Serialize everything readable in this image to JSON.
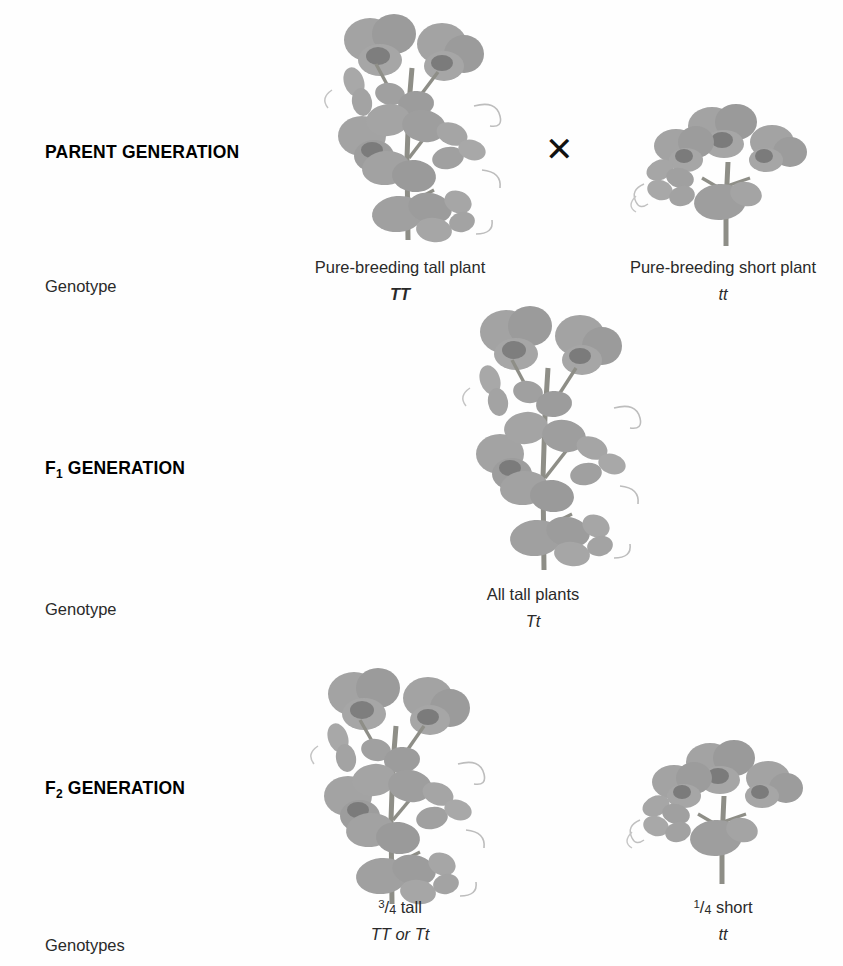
{
  "diagram": {
    "cross_symbol": "✕",
    "illustration_color": "#9a9a9a",
    "stem_color": "#8b8b84"
  },
  "rows": [
    {
      "id": "parent",
      "heading": "PARENT GENERATION",
      "heading_sub": "",
      "side_label": "Genotype",
      "organisms": [
        {
          "name": "tall-parent",
          "phenotype": "Pure-breeding tall plant",
          "genotype": "TT",
          "genotype_bold": true,
          "fraction": null,
          "plant_type": "tall"
        },
        {
          "name": "short-parent",
          "phenotype": "Pure-breeding short plant",
          "genotype": "tt",
          "genotype_bold": false,
          "fraction": null,
          "plant_type": "short"
        }
      ]
    },
    {
      "id": "f1",
      "heading": "F",
      "heading_sub": "1",
      "heading_rest": " GENERATION",
      "side_label": "Genotype",
      "organisms": [
        {
          "name": "f1-offspring",
          "phenotype": "All tall plants",
          "genotype": "Tt",
          "genotype_bold": false,
          "fraction": null,
          "plant_type": "tall"
        }
      ]
    },
    {
      "id": "f2",
      "heading": "F",
      "heading_sub": "2",
      "heading_rest": " GENERATION",
      "side_label": "Genotypes",
      "organisms": [
        {
          "name": "f2-tall",
          "phenotype": "tall",
          "fraction_numerator": "3",
          "fraction_denominator": "4",
          "genotype": "TT or Tt",
          "genotype_bold": false,
          "plant_type": "tall"
        },
        {
          "name": "f2-short",
          "phenotype": "short",
          "fraction_numerator": "1",
          "fraction_denominator": "4",
          "genotype": "tt",
          "genotype_bold": false,
          "plant_type": "short"
        }
      ]
    }
  ],
  "labels": {
    "parent_heading": "PARENT GENERATION",
    "f1_heading_base": "F",
    "f1_heading_sub": "1",
    "f1_heading_rest": " GENERATION",
    "f2_heading_base": "F",
    "f2_heading_sub": "2",
    "f2_heading_rest": " GENERATION",
    "genotype_singular": "Genotype",
    "genotype_plural": "Genotypes",
    "tall_parent_pheno": "Pure-breeding tall plant",
    "tall_parent_geno": "TT",
    "short_parent_pheno": "Pure-breeding short plant",
    "short_parent_geno": "tt",
    "f1_pheno": "All tall plants",
    "f1_geno": "Tt",
    "f2_tall_num": "3",
    "f2_tall_den": "4",
    "f2_tall_word": " tall",
    "f2_tall_geno": "TT or Tt",
    "f2_short_num": "1",
    "f2_short_den": "4",
    "f2_short_word": " short",
    "f2_short_geno": "tt",
    "cross": "✕"
  }
}
